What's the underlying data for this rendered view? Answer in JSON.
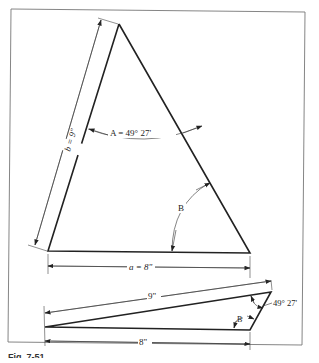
{
  "figure": {
    "caption": "Fig. 7-51",
    "top_triangle": {
      "side_b_label": "b = 9\"",
      "angle_a_label": "A = 49° 27'",
      "angle_b_label": "B",
      "side_a_label": "a = 8\""
    },
    "bottom_triangle": {
      "hypotenuse_label": "9\"",
      "base_label": "8\"",
      "angle_label": "49° 27'",
      "angle_b_label": "B"
    },
    "colors": {
      "line": "#222222",
      "frame": "#777777",
      "background": "#ffffff"
    }
  }
}
